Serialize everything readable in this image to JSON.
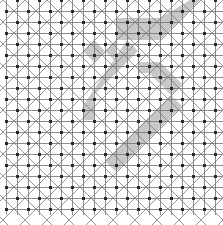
{
  "diagram": {
    "type": "grid-pattern",
    "width": 223,
    "height": 225,
    "grid": {
      "spacing": 11,
      "origin_x": 6,
      "origin_y": 0,
      "cols": 20,
      "rows": 20,
      "line_color": "#6e6e6e",
      "diagonal_color": "#7a7a7a",
      "dot_color": "#2a2a2a",
      "dot_size": 3
    },
    "shading": {
      "color": "#9a9a9a",
      "opacity": 0.55,
      "shapes": [
        {
          "name": "diamond",
          "points": [
            [
              94,
              40
            ],
            [
              105,
              51
            ],
            [
              94,
              62
            ],
            [
              83,
              51
            ]
          ]
        },
        {
          "name": "top-triangle",
          "points": [
            [
              116,
              18
            ],
            [
              160,
              18
            ],
            [
              190,
              0
            ],
            [
              200,
              0
            ],
            [
              160,
              40
            ],
            [
              116,
              40
            ],
            [
              116,
              62
            ],
            [
              105,
              51
            ],
            [
              116,
              40
            ]
          ]
        },
        {
          "name": "main-band",
          "points": [
            [
              127,
              40
            ],
            [
              138,
              51
            ],
            [
              94,
              95
            ],
            [
              94,
              120
            ],
            [
              83,
              120
            ],
            [
              83,
              106
            ]
          ]
        },
        {
          "name": "right-arm",
          "points": [
            [
              138,
              62
            ],
            [
              160,
              62
            ],
            [
              182,
              84
            ],
            [
              171,
              95
            ],
            [
              149,
              73
            ],
            [
              138,
              73
            ]
          ]
        },
        {
          "name": "lower-tail",
          "points": [
            [
              171,
              95
            ],
            [
              182,
              106
            ],
            [
              116,
              172
            ],
            [
              105,
              161
            ]
          ]
        }
      ]
    }
  }
}
